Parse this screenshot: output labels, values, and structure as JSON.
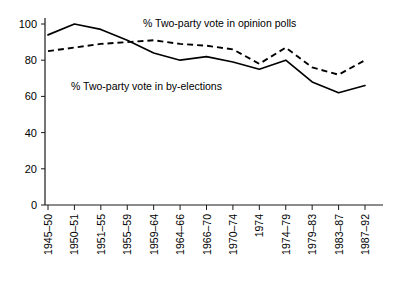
{
  "chart_data": {
    "type": "line",
    "title": "",
    "xlabel": "",
    "ylabel": "",
    "ylim": [
      0,
      100
    ],
    "yticks": [
      0,
      20,
      40,
      60,
      80,
      100
    ],
    "grid": false,
    "legend_position": "inline-annotation",
    "categories": [
      "1945–50",
      "1950–51",
      "1951–55",
      "1955–59",
      "1959–64",
      "1964–66",
      "1966–70",
      "1970–74",
      "1974",
      "1974–79",
      "1979–83",
      "1983–87",
      "1987–92"
    ],
    "series": [
      {
        "name": "% Two-party vote in by-elections",
        "style": "solid",
        "values": [
          94,
          100,
          97,
          91,
          84,
          80,
          82,
          79,
          75,
          80,
          68,
          62,
          66
        ]
      },
      {
        "name": "% Two-party vote in opinion polls",
        "style": "dashed",
        "values": [
          85,
          87,
          89,
          90,
          91,
          89,
          88,
          86,
          78,
          87,
          76,
          72,
          80
        ]
      }
    ],
    "annotations": [
      {
        "name": "opinion-polls-label",
        "text": "% Two-party vote in opinion polls",
        "x": 143,
        "y": 27
      },
      {
        "name": "by-elections-label",
        "text": "% Two-party vote in by-elections",
        "x": 71,
        "y": 90
      }
    ]
  }
}
